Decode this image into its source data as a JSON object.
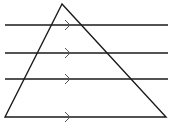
{
  "diagram": {
    "stroke_color": "#1a1a1a",
    "arrow_color": "#555555",
    "triangle": {
      "apex": [
        62,
        4
      ],
      "bottom_left": [
        5,
        117
      ],
      "bottom_right": [
        166,
        117
      ]
    },
    "parallel_lines": [
      {
        "y": 25,
        "x1": 5,
        "x2": 168,
        "arrow_x": 70
      },
      {
        "y": 53,
        "x1": 5,
        "x2": 168,
        "arrow_x": 70
      },
      {
        "y": 79,
        "x1": 5,
        "x2": 168,
        "arrow_x": 70
      }
    ],
    "base_arrow": {
      "y": 117,
      "arrow_x": 70
    }
  }
}
